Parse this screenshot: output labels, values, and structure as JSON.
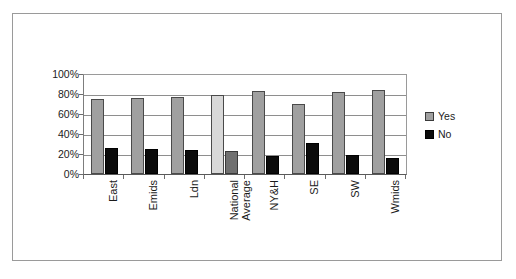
{
  "chart_data": {
    "type": "bar",
    "title": "",
    "subtitle": "",
    "xlabel": "",
    "ylabel": "",
    "ylim": [
      0,
      100
    ],
    "yticks": [
      "0%",
      "20%",
      "40%",
      "60%",
      "80%",
      "100%"
    ],
    "ytick_values": [
      0,
      20,
      40,
      60,
      80,
      100
    ],
    "grid": true,
    "legend_position": "right",
    "categories": [
      "East",
      "Emids",
      "Ldn",
      "National Average",
      "NY&H",
      "SE",
      "SW",
      "Wmids"
    ],
    "category_lines": [
      [
        "East"
      ],
      [
        "Emids"
      ],
      [
        "Ldn"
      ],
      [
        "National",
        "Average"
      ],
      [
        "NY&H"
      ],
      [
        "SE"
      ],
      [
        "SW"
      ],
      [
        "Wmids"
      ]
    ],
    "highlighted_category": "National Average",
    "series": [
      {
        "name": "Yes",
        "color": "#a0a0a0",
        "highlight_color": "#d8d8d8",
        "values": [
          75,
          76,
          77,
          79,
          83,
          70,
          82,
          84
        ]
      },
      {
        "name": "No",
        "color": "#0b0b0b",
        "highlight_color": "#707070",
        "values": [
          26,
          25,
          24,
          23,
          18,
          31,
          19,
          16
        ]
      }
    ]
  },
  "legend": {
    "items": [
      {
        "label": "Yes",
        "swatch": "yes"
      },
      {
        "label": "No",
        "swatch": "no"
      }
    ]
  }
}
